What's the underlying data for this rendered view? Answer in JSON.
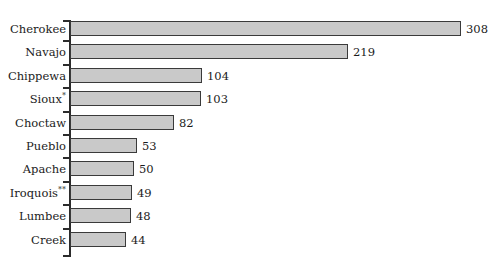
{
  "chart_data": {
    "type": "bar",
    "orientation": "horizontal",
    "title": "",
    "subtitle": "",
    "xlabel": "",
    "ylabel": "",
    "grid": false,
    "legend": null,
    "xlim": [
      0,
      320
    ],
    "categories": [
      "Cherokee",
      "Navajo",
      "Chippewa",
      "Sioux",
      "Choctaw",
      "Pueblo",
      "Apache",
      "Iroquois",
      "Lumbee",
      "Creek"
    ],
    "category_footnote_marks": [
      "",
      "",
      "",
      "*",
      "",
      "",
      "",
      "**",
      "",
      ""
    ],
    "values": [
      308,
      219,
      104,
      103,
      82,
      53,
      50,
      49,
      48,
      44
    ],
    "value_labels": [
      "308",
      "219",
      "104",
      "103",
      "82",
      "53",
      "50",
      "49",
      "48",
      "44"
    ],
    "colors": {
      "bar_fill": "#c9c9c9",
      "bar_border": "#3a3a3a",
      "axis": "#2b2b2b",
      "text": "#1b1b1b",
      "background": "#ffffff"
    }
  }
}
